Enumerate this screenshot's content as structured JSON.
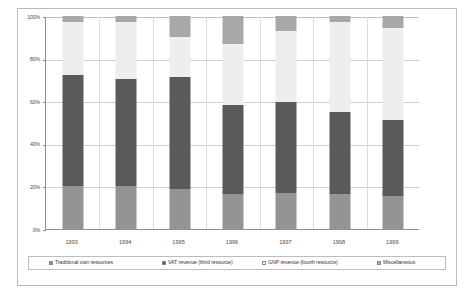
{
  "chart_data": {
    "type": "bar",
    "subtype": "stacked-percentage-column",
    "title": "",
    "xlabel": "",
    "ylabel": "",
    "ylim": [
      0,
      100
    ],
    "ytick_labels": [
      "0%",
      "20%",
      "40%",
      "60%",
      "80%",
      "100%"
    ],
    "ytick_values": [
      0,
      20,
      40,
      60,
      80,
      100
    ],
    "grid": true,
    "legend_position": "bottom",
    "categories": [
      "1993",
      "1994",
      "1995",
      "1996",
      "1997",
      "1998",
      "1999"
    ],
    "series": [
      {
        "name": "Traditional own resources",
        "color": "#949494",
        "values": [
          20.0,
          20.0,
          19.0,
          16.5,
          17.0,
          16.5,
          15.5
        ]
      },
      {
        "name": "VAT revenue (third resource)",
        "color": "#5a5a5a",
        "values": [
          52.5,
          50.5,
          52.5,
          41.5,
          42.5,
          38.5,
          35.5
        ]
      },
      {
        "name": "GNP revenue (fourth resource)",
        "color": "#eeeeee",
        "values": [
          24.5,
          26.5,
          18.5,
          29.0,
          33.5,
          42.0,
          43.5
        ]
      },
      {
        "name": "Miscellaneous",
        "color": "#a8a8a8",
        "values": [
          3.0,
          3.0,
          10.0,
          13.0,
          7.0,
          3.0,
          5.5
        ]
      }
    ],
    "cumulative_tops": {
      "1993": [
        20.0,
        72.5,
        97.0,
        100.0
      ],
      "1994": [
        20.0,
        70.5,
        97.0,
        100.0
      ],
      "1995": [
        19.0,
        71.5,
        90.0,
        100.0
      ],
      "1996": [
        16.5,
        58.0,
        87.0,
        100.0
      ],
      "1997": [
        17.0,
        59.5,
        93.0,
        100.0
      ],
      "1998": [
        16.5,
        55.0,
        97.0,
        100.0
      ],
      "1999": [
        15.5,
        51.0,
        94.5,
        100.0
      ]
    }
  },
  "legend": {
    "items": [
      {
        "label": "Traditional own resources",
        "color": "#949494"
      },
      {
        "label": "VAT revenue (third resource)",
        "color": "#5a5a5a"
      },
      {
        "label": "GNP revenue (fourth resource)",
        "color": "#ffffff"
      },
      {
        "label": "Miscellaneous",
        "color": "#a8a8a8"
      }
    ]
  }
}
